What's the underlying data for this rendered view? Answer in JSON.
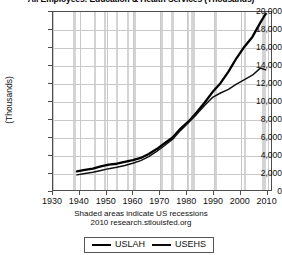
{
  "chart_data": {
    "type": "line",
    "title": "All Employees: Education & Health Services (Thousands)",
    "xlabel": "",
    "ylabel": "(Thousands)",
    "xlim": [
      1930,
      2012
    ],
    "ylim": [
      0,
      20000
    ],
    "grid": true,
    "legend_position": "bottom",
    "x_ticks": [
      "1930",
      "1940",
      "1950",
      "1960",
      "1970",
      "1980",
      "1990",
      "2000",
      "2010"
    ],
    "y_ticks": [
      "0",
      "2,000",
      "4,000",
      "6,000",
      "8,000",
      "10,000",
      "12,000",
      "14,000",
      "16,000",
      "18,000",
      "20,000"
    ],
    "series": [
      {
        "name": "USLAH",
        "color": "#000000",
        "width": "thick",
        "x": [
          1939,
          1942,
          1945,
          1948,
          1951,
          1954,
          1957,
          1960,
          1963,
          1966,
          1969,
          1972,
          1975,
          1978,
          1981,
          1984,
          1987,
          1990,
          1993,
          1996,
          1999,
          2002,
          2005,
          2008,
          2010
        ],
        "values": [
          2100,
          2250,
          2400,
          2650,
          2850,
          2950,
          3150,
          3350,
          3600,
          4050,
          4600,
          5250,
          5900,
          6900,
          7700,
          8700,
          9800,
          11000,
          12000,
          13300,
          14800,
          16100,
          17200,
          18800,
          19800
        ]
      },
      {
        "name": "USEHS",
        "color": "#111111",
        "width": "thin",
        "x": [
          1939,
          1942,
          1945,
          1948,
          1951,
          1954,
          1957,
          1960,
          1963,
          1966,
          1969,
          1972,
          1975,
          1978,
          1981,
          1984,
          1987,
          1990,
          1993,
          1996,
          1999,
          2002,
          2005,
          2008,
          2010
        ],
        "values": [
          1700,
          1850,
          2000,
          2200,
          2400,
          2550,
          2750,
          3000,
          3300,
          3750,
          4350,
          5000,
          5700,
          6700,
          7600,
          8500,
          9500,
          10400,
          10900,
          11300,
          11900,
          12400,
          12900,
          13700,
          13500
        ]
      }
    ],
    "recessions": [
      {
        "start": 1937.3,
        "end": 1938.5
      },
      {
        "start": 1945.1,
        "end": 1945.8
      },
      {
        "start": 1948.9,
        "end": 1949.8
      },
      {
        "start": 1953.5,
        "end": 1954.4
      },
      {
        "start": 1957.6,
        "end": 1958.3
      },
      {
        "start": 1960.3,
        "end": 1961.1
      },
      {
        "start": 1969.9,
        "end": 1970.9
      },
      {
        "start": 1973.9,
        "end": 1975.2
      },
      {
        "start": 1980.0,
        "end": 1980.5
      },
      {
        "start": 1981.5,
        "end": 1982.9
      },
      {
        "start": 1990.5,
        "end": 1991.2
      },
      {
        "start": 2001.2,
        "end": 2001.9
      },
      {
        "start": 2007.9,
        "end": 2009.5
      }
    ]
  },
  "footer": {
    "recession_note": "Shaded areas indicate US recessions",
    "source": "2010 research.stlouisfed.org"
  },
  "legend": {
    "entries": [
      {
        "label": "USLAH"
      },
      {
        "label": "USEHS"
      }
    ]
  }
}
